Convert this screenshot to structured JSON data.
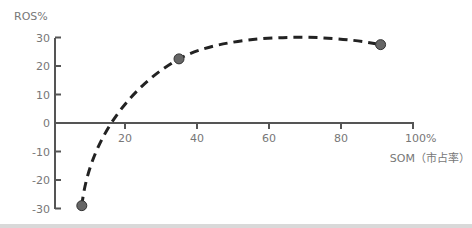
{
  "chart_data": {
    "type": "line",
    "title": "",
    "ylabel": "ROS%",
    "xlabel": "SOM（市占率）",
    "ylim": [
      -30,
      30
    ],
    "xlim": [
      0,
      100
    ],
    "yticks": [
      30,
      20,
      10,
      0,
      -10,
      -20,
      -30
    ],
    "ytick_labels": [
      "30",
      "20",
      "10",
      "0",
      "-10",
      "-20",
      "-30"
    ],
    "xticks": [
      20,
      40,
      60,
      80,
      100
    ],
    "xtick_labels": [
      "20",
      "40",
      "60",
      "80",
      "100%"
    ],
    "grid": false,
    "legend": null,
    "line_style": "dashed",
    "series": [
      {
        "name": "ROS vs SOM",
        "points": [
          {
            "x": 8,
            "y": -29
          },
          {
            "x": 35,
            "y": 22.5
          },
          {
            "x": 91,
            "y": 27.5
          }
        ]
      }
    ],
    "colors": {
      "axis": "#555555",
      "curve": "#222222",
      "marker": "#666666",
      "labels": "#777777"
    }
  }
}
